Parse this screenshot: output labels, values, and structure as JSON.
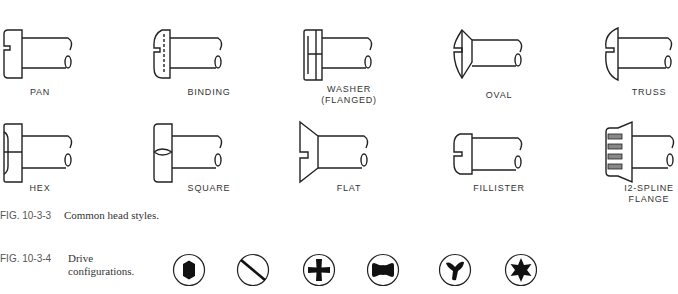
{
  "figure_head_styles": {
    "number": "FIG. 10-3-3",
    "caption": "Common head styles.",
    "row1": [
      {
        "name": "pan",
        "label": "PAN"
      },
      {
        "name": "binding",
        "label": "BINDING"
      },
      {
        "name": "washer-flanged",
        "label": "WASHER",
        "label2": "(FLANGED)"
      },
      {
        "name": "oval",
        "label": "OVAL"
      },
      {
        "name": "truss",
        "label": "TRUSS"
      }
    ],
    "row2": [
      {
        "name": "hex",
        "label": "HEX"
      },
      {
        "name": "square",
        "label": "SQUARE"
      },
      {
        "name": "flat",
        "label": "FLAT"
      },
      {
        "name": "fillister",
        "label": "FILLISTER"
      },
      {
        "name": "12-spline-flange",
        "label": "I2-SPLINE",
        "label2": "FLANGE"
      }
    ]
  },
  "figure_drive": {
    "number": "FIG. 10-3-4",
    "caption_line1": "Drive",
    "caption_line2": "configurations.",
    "drives": [
      "hex-socket",
      "slotted",
      "phillips",
      "clutch",
      "tri-wing",
      "torx"
    ]
  }
}
